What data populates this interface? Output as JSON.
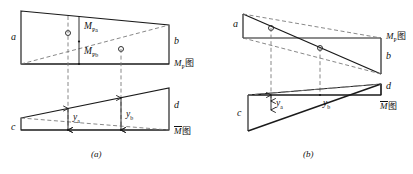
{
  "figure": {
    "title_caption_a": "(a)",
    "title_caption_b": "(b)",
    "stroke_color": "#1a1a1a",
    "dash_color": "#7a7a7a",
    "background": "#ffffff"
  },
  "panel_a": {
    "caption": "(a)",
    "mp_diagram": {
      "name": "M_P diagram",
      "chart_label": "M",
      "chart_label_sub": "P",
      "chart_label_cjk": "图",
      "left_edge_label": "a",
      "right_edge_label": "b",
      "ordinate_upper_label": "M",
      "ordinate_upper_sub": "Pa",
      "ordinate_lower_label": "M",
      "ordinate_lower_sub": "Pb",
      "centroid_markers": 2
    },
    "mbar_diagram": {
      "name": "M bar diagram",
      "chart_label": "M",
      "chart_label_cjk": "图",
      "left_edge_label": "c",
      "right_edge_label": "d",
      "ordinate_a_label": "y",
      "ordinate_a_sub": "a",
      "ordinate_b_label": "y",
      "ordinate_b_sub": "b"
    }
  },
  "panel_b": {
    "caption": "(b)",
    "mp_diagram": {
      "name": "M_P diagram",
      "chart_label": "M",
      "chart_label_sub": "P",
      "chart_label_cjk": "图",
      "left_edge_label": "a",
      "right_edge_label": "b",
      "centroid_markers": 2
    },
    "mbar_diagram": {
      "name": "M bar diagram",
      "chart_label": "M",
      "chart_label_cjk": "图",
      "left_edge_label": "c",
      "right_edge_label": "d",
      "ordinate_a_label": "y",
      "ordinate_a_sub": "a",
      "ordinate_b_label": "y",
      "ordinate_b_sub": "b"
    }
  }
}
